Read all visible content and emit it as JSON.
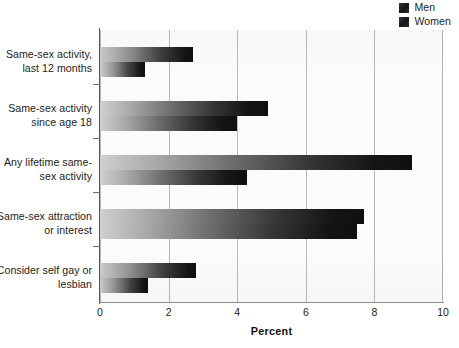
{
  "legend": {
    "position": "top-right",
    "swatch_color": "#262626",
    "entries": [
      {
        "label": "Men",
        "icon": "legend-swatch-icon"
      },
      {
        "label": "Women",
        "icon": "legend-swatch-icon"
      }
    ]
  },
  "axis": {
    "x_title": "Percent",
    "x_ticks": [
      "0",
      "2",
      "4",
      "6",
      "8",
      "10"
    ]
  },
  "chart_data": {
    "type": "bar",
    "orientation": "horizontal",
    "title": "",
    "subtitle": "",
    "xlabel": "Percent",
    "ylabel": "",
    "xlim": [
      0,
      10
    ],
    "xticks": [
      0,
      2,
      4,
      6,
      8,
      10
    ],
    "grid": "vertical",
    "legend_position": "top-right",
    "categories": [
      "Same-sex activity, last 12 months",
      "Same-sex activity since age 18",
      "Any lifetime same-sex activity",
      "Same-sex attraction or interest",
      "Consider self gay or lesbian"
    ],
    "category_lines": [
      [
        "Same-sex activity,",
        "last 12 months"
      ],
      [
        "Same-sex activity",
        "since age 18"
      ],
      [
        "Any lifetime same-",
        "sex activity"
      ],
      [
        "Same-sex attraction",
        "or interest"
      ],
      [
        "Consider self gay or",
        "lesbian"
      ]
    ],
    "series": [
      {
        "name": "Men",
        "values": [
          2.7,
          4.9,
          9.1,
          7.7,
          2.8
        ]
      },
      {
        "name": "Women",
        "values": [
          1.3,
          4.0,
          4.3,
          7.5,
          1.4
        ]
      }
    ]
  }
}
